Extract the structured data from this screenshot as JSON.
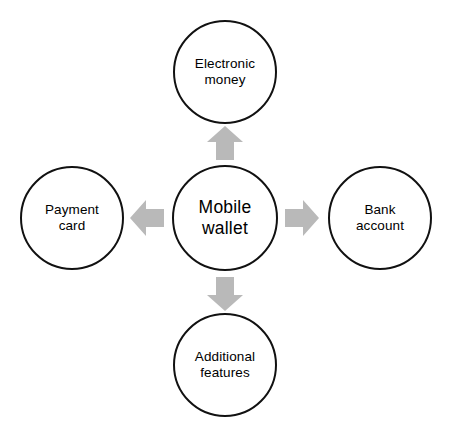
{
  "diagram": {
    "type": "radial-hub-and-spoke",
    "center": {
      "id": "mobile-wallet",
      "label": "Mobile\nwallet"
    },
    "nodes": [
      {
        "id": "electronic-money",
        "label": "Electronic\nmoney",
        "position": "top"
      },
      {
        "id": "payment-card",
        "label": "Payment\ncard",
        "position": "left"
      },
      {
        "id": "bank-account",
        "label": "Bank\naccount",
        "position": "right"
      },
      {
        "id": "additional-features",
        "label": "Additional\nfeatures",
        "position": "bottom"
      }
    ],
    "arrows": [
      {
        "id": "arrow-up",
        "direction": "up",
        "from": "mobile-wallet",
        "to": "electronic-money"
      },
      {
        "id": "arrow-left",
        "direction": "left",
        "from": "mobile-wallet",
        "to": "payment-card"
      },
      {
        "id": "arrow-right",
        "direction": "right",
        "from": "mobile-wallet",
        "to": "bank-account"
      },
      {
        "id": "arrow-down",
        "direction": "down",
        "from": "mobile-wallet",
        "to": "additional-features"
      }
    ],
    "colors": {
      "background": "#ffffff",
      "circle_fill": "#ffffff",
      "circle_stroke": "#111111",
      "arrow_fill": "#b9b9b9",
      "text": "#000000"
    }
  }
}
